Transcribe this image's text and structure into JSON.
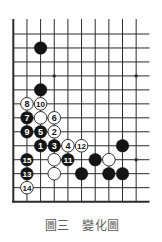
{
  "diagram": {
    "caption": "圖三　變化圖",
    "board": {
      "region": "lower-left corner",
      "columns": 10,
      "rows": 13,
      "edges_shown": [
        "left",
        "bottom"
      ]
    },
    "star_points": [
      {
        "col": 3,
        "row": 3
      },
      {
        "col": 9,
        "row": 3
      },
      {
        "col": 9,
        "row": 9
      }
    ],
    "stones": [
      {
        "color": "black",
        "col": 2,
        "row": 1,
        "label": ""
      },
      {
        "color": "black",
        "col": 2,
        "row": 4,
        "label": ""
      },
      {
        "color": "white",
        "col": 1,
        "row": 5,
        "label": "8"
      },
      {
        "color": "white",
        "col": 2,
        "row": 5,
        "label": "10"
      },
      {
        "color": "black",
        "col": 1,
        "row": 6,
        "label": "7"
      },
      {
        "color": "white",
        "col": 2,
        "row": 6,
        "label": ""
      },
      {
        "color": "white",
        "col": 3,
        "row": 6,
        "label": "6"
      },
      {
        "color": "black",
        "col": 1,
        "row": 7,
        "label": "9"
      },
      {
        "color": "black",
        "col": 2,
        "row": 7,
        "label": "5"
      },
      {
        "color": "white",
        "col": 3,
        "row": 7,
        "label": "2"
      },
      {
        "color": "black",
        "col": 2,
        "row": 8,
        "label": "1"
      },
      {
        "color": "black",
        "col": 3,
        "row": 8,
        "label": "3"
      },
      {
        "color": "white",
        "col": 4,
        "row": 8,
        "label": "4"
      },
      {
        "color": "white",
        "col": 5,
        "row": 8,
        "label": "12"
      },
      {
        "color": "black",
        "col": 8,
        "row": 8,
        "label": ""
      },
      {
        "color": "black",
        "col": 1,
        "row": 9,
        "label": "15"
      },
      {
        "color": "white",
        "col": 3,
        "row": 9,
        "label": ""
      },
      {
        "color": "black",
        "col": 4,
        "row": 9,
        "label": "11"
      },
      {
        "color": "black",
        "col": 6,
        "row": 9,
        "label": ""
      },
      {
        "color": "white",
        "col": 7,
        "row": 9,
        "label": ""
      },
      {
        "color": "black",
        "col": 1,
        "row": 10,
        "label": "13"
      },
      {
        "color": "white",
        "col": 3,
        "row": 10,
        "label": ""
      },
      {
        "color": "black",
        "col": 5,
        "row": 10,
        "label": ""
      },
      {
        "color": "black",
        "col": 7,
        "row": 10,
        "label": ""
      },
      {
        "color": "black",
        "col": 8,
        "row": 10,
        "label": ""
      },
      {
        "color": "white",
        "col": 1,
        "row": 11,
        "label": "14"
      }
    ]
  },
  "colors": {
    "grid_line": "#2b2b2b",
    "black_stone": "#141414",
    "white_stone": "#ffffff",
    "white_stone_outline": "#1e1e1e",
    "black_stone_label": "#ffffff",
    "white_stone_label": "#141414",
    "caption": "#5e5e5e"
  }
}
